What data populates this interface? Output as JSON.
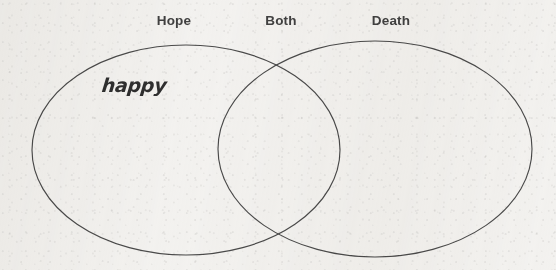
{
  "worksheet": {
    "background_color": "#f4f3f1",
    "ink_color": "#4a4a4a",
    "label_color": "#414141",
    "handwriting_color": "#2f2f2f"
  },
  "diagram": {
    "type": "venn",
    "set_count": 2,
    "left_circle": {
      "cx": 186,
      "cy": 150,
      "rx": 154,
      "ry": 105
    },
    "right_circle": {
      "cx": 375,
      "cy": 149,
      "rx": 157,
      "ry": 108
    },
    "labels": [
      {
        "id": "left",
        "text": "Hope",
        "x": 174,
        "y": 14
      },
      {
        "id": "overlap",
        "text": "Both",
        "x": 281,
        "y": 14
      },
      {
        "id": "right",
        "text": "Death",
        "x": 391,
        "y": 14
      }
    ],
    "entries": [
      {
        "id": "entry-1",
        "text": "happy",
        "region": "left",
        "x": 102,
        "y": 76
      }
    ]
  }
}
